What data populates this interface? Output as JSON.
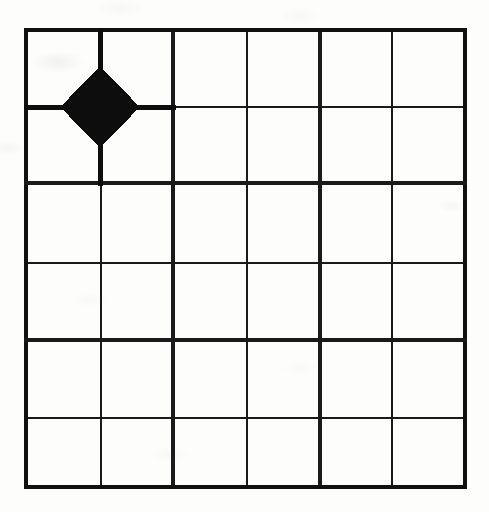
{
  "figure": {
    "kind": "grid-diagram",
    "caption": "",
    "background_color": "#fdfdfc",
    "ink_color": "#121212",
    "canvas": {
      "width": 489,
      "height": 512
    }
  },
  "grid": {
    "columns": 6,
    "rows": 6,
    "block_columns": 3,
    "block_rows": 3,
    "cells_per_block_x": 2,
    "cells_per_block_y": 2,
    "x_positions": [
      26,
      101,
      173,
      247,
      320,
      392,
      465
    ],
    "y_positions": [
      30,
      107,
      183,
      263,
      340,
      418,
      487
    ],
    "vertical_line_weights": [
      "thick",
      "thin",
      "thick",
      "thin",
      "thick",
      "thin",
      "thick"
    ],
    "horizontal_line_weights": [
      "thick",
      "thin",
      "thick",
      "thin",
      "thick",
      "thin",
      "thick"
    ],
    "stroke_thick": 4.2,
    "stroke_medium": 3.4,
    "stroke_thin": 1.5,
    "outer_border_color": "#111111",
    "interior_line_color": "#1a1a1a"
  },
  "markers": [
    {
      "id": "marker-1",
      "shape": "diamond",
      "fill": "#0d0d0d",
      "label": "",
      "vertex_x": 1,
      "vertex_y": 1,
      "center_x": 100,
      "center_y": 107,
      "radius_x": 39,
      "radius_y": 40,
      "spokes": [
        "up",
        "down",
        "left",
        "right"
      ],
      "spoke_width": 5.0,
      "spoke_length_cells": 1
    }
  ],
  "legend": {
    "visible": false,
    "entries": []
  },
  "axes": {
    "visible": false,
    "x_tick_labels": [],
    "y_tick_labels": []
  }
}
